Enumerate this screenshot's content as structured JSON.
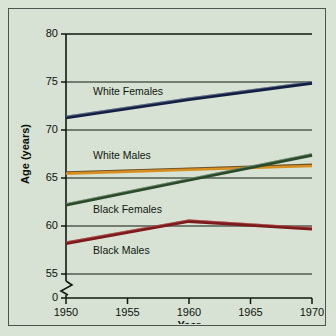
{
  "figure": {
    "background_color": "#d7e2d4",
    "border_color": "#4a5450"
  },
  "chart_data": {
    "type": "line",
    "title": "",
    "xlabel": "Year",
    "ylabel": "Age (years)",
    "xlim": [
      1950,
      1970
    ],
    "ylim": [
      55,
      80
    ],
    "y_axis_break": true,
    "y_break_label": "0",
    "grid": true,
    "legend": "inline-labels",
    "xticks": [
      1950,
      1955,
      1960,
      1965,
      1970
    ],
    "xtick_labels": [
      "1950",
      "1955",
      "1960",
      "1965",
      "1970"
    ],
    "yticks": [
      55,
      60,
      65,
      70,
      75,
      80
    ],
    "ytick_labels": [
      "55",
      "60",
      "65",
      "70",
      "75",
      "80"
    ],
    "x": [
      1950,
      1960,
      1970
    ],
    "series": [
      {
        "name": "White Females",
        "color": "#131f42",
        "highlight": "#8f9ab5",
        "values": [
          71.3,
          73.2,
          74.9
        ],
        "label_x": 1952.2,
        "label_y": 73.6
      },
      {
        "name": "White Males",
        "color": "#d78f22",
        "highlight": "#1d1c16",
        "values": [
          65.5,
          65.9,
          66.3
        ],
        "label_x": 1952.2,
        "label_y": 67.0
      },
      {
        "name": "Black Females",
        "color": "#2b4a2c",
        "highlight": "#9fb79c",
        "values": [
          62.2,
          64.8,
          67.4
        ],
        "label_x": 1952.2,
        "label_y": 61.4
      },
      {
        "name": "Black Males",
        "color": "#7c1a1c",
        "highlight": "#c96a62",
        "values": [
          58.2,
          60.5,
          59.7
        ],
        "label_x": 1952.2,
        "label_y": 57.1
      }
    ]
  }
}
